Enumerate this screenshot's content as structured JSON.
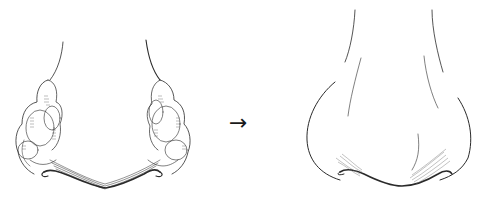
{
  "figure": {
    "panels": [
      {
        "id": "before",
        "description": "Nose with rhinophyma (lobulated, bulbous overgrowth of nasal alae)"
      },
      {
        "id": "after",
        "description": "Normal nose contour after treatment"
      }
    ],
    "arrow": {
      "glyph": "→"
    },
    "colors": {
      "line": "#2a2a2a",
      "hatch": "#555555",
      "background": "#ffffff"
    }
  }
}
